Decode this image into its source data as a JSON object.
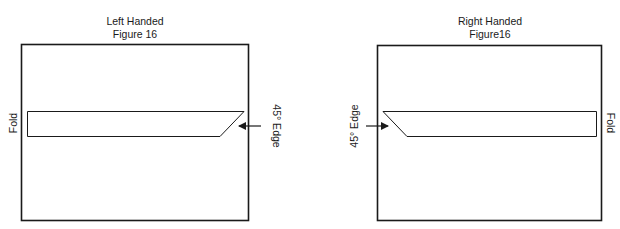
{
  "figures": [
    {
      "id": "left",
      "title": "Left Handed",
      "subtitle": "Figure 16",
      "fold_label": "Fold",
      "edge_label": "45° Edge",
      "fold_side": "left",
      "edge_side": "right"
    },
    {
      "id": "right",
      "title": "Right Handed",
      "subtitle": "Figure16",
      "fold_label": "Fold",
      "edge_label": "45° Edge",
      "fold_side": "right",
      "edge_side": "left"
    }
  ],
  "colors": {
    "stroke": "#1a1a1a",
    "background": "#ffffff"
  }
}
